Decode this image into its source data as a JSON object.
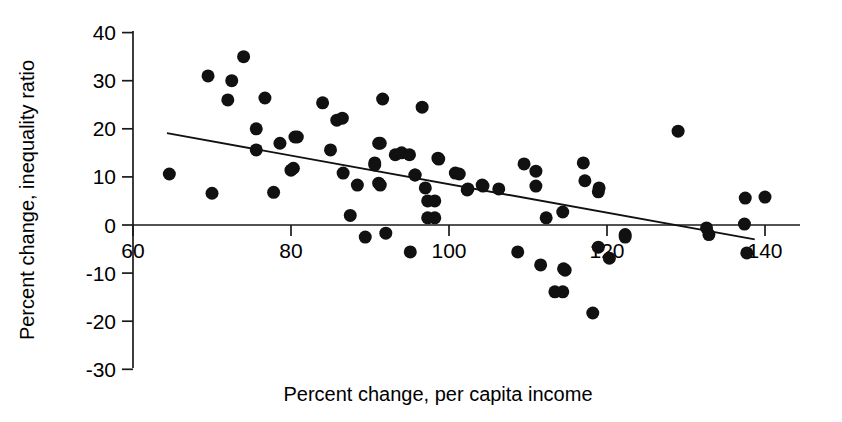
{
  "chart_data": {
    "type": "scatter",
    "title": "",
    "subtitle": "",
    "xlabel": "Percent change, per capita income",
    "ylabel": "Percent change, inequality ratio",
    "xlim": [
      58,
      146
    ],
    "ylim": [
      -30,
      40
    ],
    "xticks": [
      60,
      80,
      100,
      120,
      140
    ],
    "yticks": [
      40,
      30,
      20,
      10,
      0,
      -10,
      -20,
      -30
    ],
    "xtick_labels": [
      "60",
      "80",
      "100",
      "120",
      "140"
    ],
    "ytick_labels": [
      "40",
      "30",
      "20",
      "10",
      "0",
      "-10",
      "-20",
      "-30"
    ],
    "grid": false,
    "legend": null,
    "legend_position": "none",
    "marker": "filled-circle",
    "marker_color": "#111111",
    "marker_size_px": 13,
    "axis_color": "#1a1a1a",
    "background_color": "#ffffff",
    "x": [
      64.6,
      69.5,
      70.0,
      72.0,
      72.5,
      74.0,
      75.6,
      75.6,
      76.7,
      77.8,
      78.6,
      80.0,
      80.3,
      80.5,
      80.8,
      84.0,
      85.0,
      85.8,
      86.5,
      86.6,
      87.5,
      88.4,
      89.4,
      90.6,
      90.6,
      91.1,
      91.1,
      91.3,
      91.3,
      91.6,
      92.0,
      93.2,
      94.0,
      95.0,
      95.1,
      95.7,
      95.7,
      96.6,
      97.0,
      97.3,
      97.3,
      98.2,
      98.2,
      98.6,
      98.7,
      100.8,
      101.3,
      102.3,
      102.4,
      104.2,
      104.3,
      106.3,
      108.7,
      109.5,
      111.0,
      111.0,
      111.6,
      112.3,
      113.4,
      114.4,
      114.4,
      114.5,
      114.7,
      117.0,
      117.2,
      118.2,
      118.9,
      118.9,
      119.0,
      120.3,
      122.3,
      122.3,
      129.0,
      132.6,
      132.9,
      137.4,
      137.5,
      137.7,
      140.0
    ],
    "y": [
      10.6,
      31.0,
      6.6,
      26.0,
      30.0,
      35.0,
      20.0,
      15.6,
      26.4,
      6.8,
      17.0,
      11.4,
      11.8,
      18.3,
      18.3,
      25.4,
      15.6,
      21.8,
      22.2,
      10.8,
      2.0,
      8.3,
      -2.5,
      12.9,
      12.5,
      17.0,
      8.7,
      17.0,
      8.3,
      26.2,
      -1.7,
      14.6,
      15.0,
      14.6,
      -5.6,
      10.4,
      10.4,
      24.5,
      7.7,
      5.0,
      1.5,
      5.0,
      1.5,
      13.9,
      13.7,
      10.8,
      10.6,
      7.3,
      7.5,
      8.3,
      8.1,
      7.5,
      -5.6,
      12.7,
      11.2,
      8.1,
      -8.3,
      1.5,
      -13.9,
      2.7,
      -13.9,
      -9.1,
      -9.4,
      12.9,
      9.2,
      -18.3,
      6.9,
      -4.6,
      7.7,
      -6.9,
      -2.0,
      -2.5,
      19.5,
      -0.6,
      -2.0,
      0.2,
      5.6,
      -5.8,
      5.8
    ],
    "fit_line": {
      "label": "",
      "x_start": 64.3,
      "y_start": 19.1,
      "x_end": 138.7,
      "y_end": -3.0
    }
  },
  "axis": {
    "y_title": "Percent change, inequality ratio",
    "x_title": "Percent change, per capita income"
  }
}
